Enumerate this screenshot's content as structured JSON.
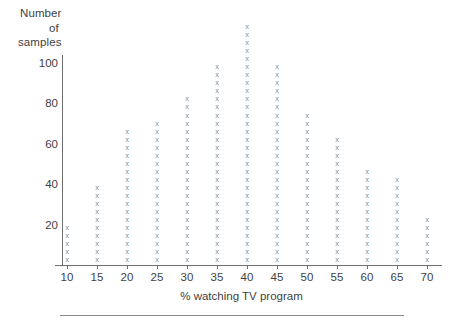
{
  "chart_data": {
    "type": "scatter",
    "title": "",
    "xlabel": "% watching TV program",
    "ylabel": "Number of samples",
    "ylabel_lines": [
      "Number",
      "of",
      "samples"
    ],
    "categories": [
      10,
      15,
      20,
      25,
      30,
      35,
      40,
      45,
      50,
      55,
      60,
      65,
      70
    ],
    "values": [
      20,
      40,
      67,
      70,
      80,
      93,
      115,
      95,
      73,
      61,
      45,
      41,
      21
    ],
    "marks": [
      5,
      10,
      17,
      18,
      21,
      25,
      30,
      25,
      19,
      16,
      12,
      11,
      6
    ],
    "mark_glyph": "x",
    "units_per_mark": 4,
    "xtick_labels": [
      "10",
      "15",
      "20",
      "25",
      "30",
      "35",
      "40",
      "45",
      "50",
      "55",
      "60",
      "65",
      "70"
    ],
    "ytick_labels": [
      "20",
      "40",
      "60",
      "80",
      "100"
    ],
    "ytick_values": [
      20,
      40,
      60,
      80,
      100
    ],
    "xlim": [
      7.5,
      72.5
    ],
    "ylim": [
      0,
      112
    ],
    "grid": false,
    "legend": null,
    "axis_color": "#6f6f6f",
    "mark_color": "#8d8d8d",
    "text_color": "#3f3f3f"
  }
}
